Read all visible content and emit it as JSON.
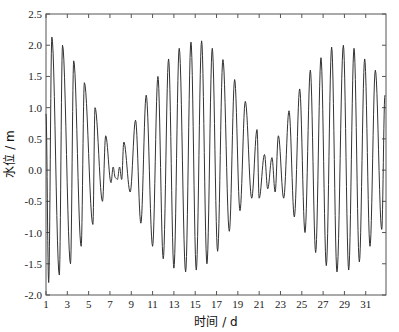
{
  "chart_data": {
    "type": "line",
    "title": "",
    "xlabel": "时间 / d",
    "ylabel": "水位 / m",
    "xlim": [
      1,
      32.9
    ],
    "ylim": [
      -2.0,
      2.5
    ],
    "xticks": [
      1,
      3,
      5,
      7,
      9,
      11,
      13,
      15,
      17,
      19,
      21,
      23,
      25,
      27,
      29,
      31
    ],
    "yticks": [
      -2.0,
      -1.5,
      -1.0,
      -0.5,
      0.0,
      0.5,
      1.0,
      1.5,
      2.0,
      2.5
    ],
    "ytick_labels": [
      "-2.0",
      "-1.5",
      "-1.0",
      "-0.5",
      "0.0",
      "0.5",
      "1.0",
      "1.5",
      "2.0",
      "2.5"
    ],
    "grid": false,
    "legend": null,
    "line_color": "#333333",
    "series": [
      {
        "name": "水位",
        "x": [
          1.0,
          1.25,
          1.55,
          2.25,
          2.55,
          3.3,
          3.6,
          4.3,
          4.6,
          5.4,
          5.6,
          6.3,
          6.6,
          7.1,
          7.3,
          7.5,
          7.7,
          7.9,
          8.1,
          8.3,
          8.9,
          9.4,
          9.9,
          10.4,
          11.0,
          11.5,
          12.0,
          12.5,
          13.0,
          13.5,
          14.1,
          14.6,
          15.1,
          15.6,
          16.1,
          16.6,
          17.1,
          17.6,
          18.2,
          18.7,
          19.2,
          19.7,
          20.3,
          20.8,
          21.0,
          21.5,
          21.8,
          22.2,
          22.5,
          22.8,
          23.3,
          23.8,
          24.3,
          24.8,
          25.3,
          25.8,
          26.3,
          26.8,
          27.3,
          27.8,
          28.3,
          28.9,
          29.4,
          29.9,
          30.4,
          30.9,
          31.4,
          31.9,
          32.5,
          32.8
        ],
        "values": [
          0.9,
          -1.8,
          2.13,
          -1.68,
          2.0,
          -1.5,
          1.75,
          -1.22,
          1.4,
          -0.87,
          1.0,
          -0.5,
          0.55,
          -0.2,
          0.05,
          -0.12,
          -0.15,
          0.05,
          -0.15,
          0.45,
          -0.35,
          0.8,
          -0.85,
          1.2,
          -1.22,
          1.5,
          -1.42,
          1.78,
          -1.57,
          1.95,
          -1.63,
          2.05,
          -1.6,
          2.07,
          -1.5,
          1.95,
          -1.3,
          1.77,
          -0.98,
          1.45,
          -0.65,
          1.1,
          -0.45,
          0.65,
          -0.45,
          0.25,
          -0.3,
          0.2,
          -0.35,
          0.55,
          -0.45,
          0.95,
          -0.75,
          1.3,
          -1.0,
          1.6,
          -1.32,
          1.8,
          -1.53,
          1.97,
          -1.63,
          2.0,
          -1.6,
          1.95,
          -1.47,
          1.78,
          -1.22,
          1.6,
          -0.95,
          1.2
        ]
      }
    ]
  }
}
